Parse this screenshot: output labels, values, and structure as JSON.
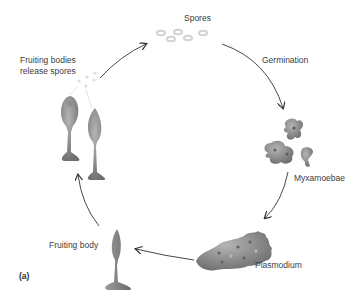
{
  "diagram": {
    "type": "life-cycle",
    "panel_label": "(a)",
    "stages": [
      {
        "id": "spores",
        "label": "Spores"
      },
      {
        "id": "germination",
        "label": "Germination"
      },
      {
        "id": "myxamoebae",
        "label": "Myxamoebae"
      },
      {
        "id": "plasmodium",
        "label": "Plasmodium"
      },
      {
        "id": "fruiting-body",
        "label": "Fruiting body"
      },
      {
        "id": "fruiting-bodies-release",
        "label_line1": "Fruiting bodies",
        "label_line2": "release spores"
      }
    ],
    "colors": {
      "organism": "#7a7a7a",
      "organism_light": "#a8a8a8",
      "spore": "#d0d0d0",
      "arrow": "#333333"
    }
  }
}
